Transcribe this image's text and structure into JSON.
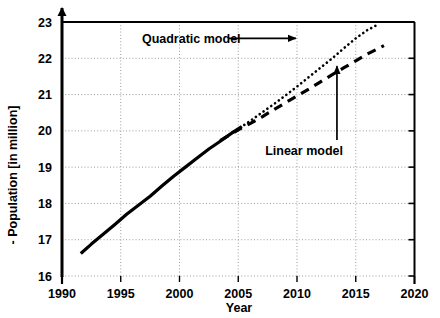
{
  "chart_data": {
    "type": "line",
    "title": "",
    "xlabel": "Year",
    "ylabel": "Population [in million]",
    "ylabel_prefix": "-",
    "xlim": [
      1990,
      2020
    ],
    "ylim": [
      16,
      23
    ],
    "grid": true,
    "grid_style": "dotted",
    "legend_position": "none",
    "xticks": [
      1990,
      1995,
      2000,
      2005,
      2010,
      2015,
      2020
    ],
    "yticks": [
      16,
      17,
      18,
      19,
      20,
      21,
      22,
      23
    ],
    "xtick_labels": [
      "1990",
      "1995",
      "2000",
      "2005",
      "2010",
      "2015",
      "2020"
    ],
    "ytick_labels": [
      "16",
      "17",
      "18",
      "19",
      "20",
      "21",
      "22",
      "23"
    ],
    "series": [
      {
        "name": "Observed data",
        "style": "solid",
        "color": "#000000",
        "width": 3.2,
        "x": [
          1991.6,
          1992.5,
          1993.5,
          1994.5,
          1995.5,
          1996.5,
          1997.5,
          1998.5,
          1999.5,
          2000.5,
          2001.5,
          2002.5,
          2003.5,
          2004.5,
          2005.3
        ],
        "values": [
          16.62,
          16.88,
          17.15,
          17.42,
          17.7,
          17.95,
          18.2,
          18.48,
          18.75,
          19.0,
          19.25,
          19.5,
          19.72,
          19.95,
          20.12
        ]
      },
      {
        "name": "Quadratic model",
        "style": "dotted",
        "color": "#000000",
        "width": 2.6,
        "x": [
          2003.5,
          2005,
          2006,
          2007,
          2008,
          2009,
          2010,
          2011,
          2012,
          2013,
          2014,
          2015,
          2016,
          2016.7
        ],
        "values": [
          19.74,
          20.05,
          20.27,
          20.5,
          20.73,
          20.97,
          21.22,
          21.48,
          21.74,
          22.0,
          22.28,
          22.55,
          22.78,
          22.9
        ]
      },
      {
        "name": "Linear model",
        "style": "dashed",
        "color": "#000000",
        "width": 3.2,
        "x": [
          2003.5,
          2005,
          2006,
          2007,
          2008,
          2009,
          2010,
          2011,
          2012,
          2013,
          2014,
          2015,
          2016,
          2017.4
        ],
        "values": [
          19.74,
          20.03,
          20.2,
          20.38,
          20.58,
          20.77,
          20.96,
          21.15,
          21.35,
          21.55,
          21.74,
          21.93,
          22.12,
          22.35
        ]
      }
    ],
    "annotations": [
      {
        "name": "quadratic-model",
        "text": "Quadratic model",
        "text_x": 2001.0,
        "text_y": 22.55,
        "arrow_from_x": 2004.2,
        "arrow_from_y": 22.55,
        "arrow_to_x": 2009.9,
        "arrow_to_y": 22.55,
        "arrow_direction": "right"
      },
      {
        "name": "linear-model",
        "text": "Linear model",
        "text_x": 2010.6,
        "text_y": 19.45,
        "arrow_from_x": 2013.4,
        "arrow_from_y": 19.75,
        "arrow_to_x": 2013.4,
        "arrow_to_y": 21.78,
        "arrow_direction": "up"
      }
    ]
  }
}
